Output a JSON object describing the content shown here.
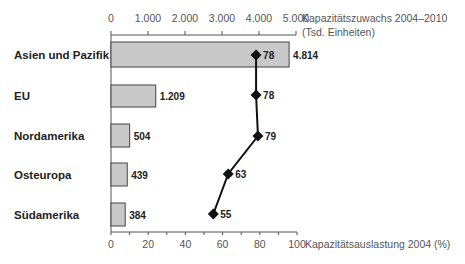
{
  "chart_data": {
    "type": "bar",
    "combo": "horizontal bar + line with markers (dual x-axis)",
    "categories": [
      "Asien und Pazifik",
      "EU",
      "Nordamerika",
      "Osteuropa",
      "Südamerika"
    ],
    "series": [
      {
        "name": "Kapazitätszuwachs 2004–2010 (Tsd. Einheiten)",
        "type": "bar",
        "axis": "top",
        "values": [
          4814,
          1209,
          504,
          439,
          384
        ],
        "labels": [
          "4.814",
          "1.209",
          "504",
          "439",
          "384"
        ]
      },
      {
        "name": "Kapazitätsauslastung 2004 (%)",
        "type": "line",
        "axis": "bottom",
        "marker": "diamond",
        "values": [
          78,
          78,
          79,
          63,
          55
        ],
        "labels": [
          "78",
          "78",
          "79",
          "63",
          "55"
        ]
      }
    ],
    "top_axis": {
      "label_line1": "Kapazitätszuwachs 2004–2010",
      "label_line2": "(Tsd. Einheiten)",
      "range": [
        0,
        5000
      ],
      "ticks": [
        "0",
        "1.000",
        "2.000",
        "3.000",
        "4.000",
        "5.000"
      ]
    },
    "bottom_axis": {
      "label": "Kapazitätsauslastung 2004 (%)",
      "range": [
        0,
        100
      ],
      "ticks": [
        "0",
        "20",
        "40",
        "60",
        "80",
        "100"
      ]
    },
    "grid": false,
    "legend": "none",
    "colors": {
      "bar_fill": "#c8c8c8",
      "bar_stroke": "#444444",
      "line": "#111111",
      "axis": "#555555"
    }
  }
}
